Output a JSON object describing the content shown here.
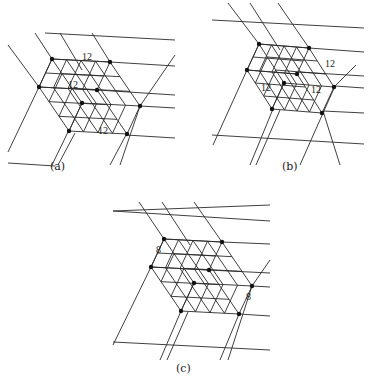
{
  "colors": {
    "line": "#2a2a2a",
    "dot": "#111111",
    "background": "#ffffff"
  },
  "panels": [
    {
      "id": "a",
      "caption": "(a)",
      "caption_pos": [
        50,
        168
      ],
      "origin": [
        52,
        59
      ],
      "A": [
        58,
        3
      ],
      "B": [
        30,
        44
      ],
      "C": [
        -13,
        28
      ],
      "divA": 4,
      "divB": 3,
      "divC": 2,
      "extra_lines": [
        [
          [
            45,
            33
          ],
          [
            175,
            40
          ]
        ],
        [
          [
            110,
            62
          ],
          [
            175,
            66
          ]
        ],
        [
          [
            97,
            90
          ],
          [
            175,
            95
          ]
        ],
        [
          [
            140,
            106
          ],
          [
            175,
            108
          ]
        ],
        [
          [
            126,
            135
          ],
          [
            175,
            138
          ]
        ],
        [
          [
            8,
            163
          ],
          [
            55,
            166
          ]
        ],
        [
          [
            8,
            45
          ],
          [
            39,
            87
          ]
        ],
        [
          [
            39,
            87
          ],
          [
            8,
            152
          ]
        ],
        [
          [
            35,
            33
          ],
          [
            52,
            59
          ]
        ],
        [
          [
            60,
            33
          ],
          [
            82,
            70
          ]
        ],
        [
          [
            92,
            33
          ],
          [
            110,
            62
          ]
        ],
        [
          [
            140,
            106
          ],
          [
            175,
            55
          ]
        ],
        [
          [
            126,
            135
          ],
          [
            110,
            165
          ]
        ],
        [
          [
            140,
            106
          ],
          [
            120,
            165
          ]
        ],
        [
          [
            68,
            132
          ],
          [
            52,
            165
          ]
        ],
        [
          [
            75,
            133
          ],
          [
            58,
            165
          ]
        ]
      ],
      "labels": [
        {
          "text": "12",
          "pos": [
            82,
            52
          ]
        },
        {
          "text": "12",
          "pos": [
            68,
            80
          ]
        },
        {
          "text": "12",
          "pos": [
            98,
            126
          ]
        }
      ]
    },
    {
      "id": "b",
      "caption": "(b)",
      "caption_pos": [
        282,
        168
      ],
      "origin": [
        259,
        44
      ],
      "A": [
        50,
        4
      ],
      "B": [
        25,
        39
      ],
      "C": [
        -12,
        26
      ],
      "divA": 4,
      "divB": 3,
      "divC": 2,
      "extra_lines": [
        [
          [
            212,
            20
          ],
          [
            364,
            28
          ]
        ],
        [
          [
            309,
            48
          ],
          [
            364,
            52
          ]
        ],
        [
          [
            298,
            72
          ],
          [
            364,
            76
          ]
        ],
        [
          [
            335,
            86
          ],
          [
            364,
            88
          ]
        ],
        [
          [
            323,
            111
          ],
          [
            364,
            113
          ]
        ],
        [
          [
            212,
            135
          ],
          [
            364,
            144
          ]
        ],
        [
          [
            228,
            3
          ],
          [
            259,
            44
          ]
        ],
        [
          [
            250,
            3
          ],
          [
            280,
            50
          ]
        ],
        [
          [
            278,
            3
          ],
          [
            309,
            48
          ]
        ],
        [
          [
            247,
            70
          ],
          [
            213,
            145
          ]
        ],
        [
          [
            335,
            86
          ],
          [
            356,
            65
          ]
        ],
        [
          [
            335,
            86
          ],
          [
            300,
            165
          ]
        ],
        [
          [
            323,
            111
          ],
          [
            340,
            165
          ]
        ],
        [
          [
            273,
            109
          ],
          [
            250,
            165
          ]
        ],
        [
          [
            280,
            110
          ],
          [
            256,
            165
          ]
        ]
      ],
      "labels": [
        {
          "text": "12",
          "pos": [
            325,
            59
          ]
        },
        {
          "text": "12",
          "pos": [
            261,
            83
          ]
        },
        {
          "text": "12",
          "pos": [
            311,
            85
          ]
        }
      ]
    },
    {
      "id": "c",
      "caption": "(c)",
      "caption_pos": [
        176,
        370
      ],
      "origin": [
        164,
        239
      ],
      "A": [
        58,
        3
      ],
      "B": [
        30,
        44
      ],
      "C": [
        -13,
        28
      ],
      "divA": 4,
      "divB": 3,
      "divC": 2,
      "extra_lines": [
        [
          [
            113,
            211
          ],
          [
            270,
            205
          ]
        ],
        [
          [
            113,
            211
          ],
          [
            270,
            221
          ]
        ],
        [
          [
            222,
            242
          ],
          [
            270,
            244
          ]
        ],
        [
          [
            208,
            270
          ],
          [
            270,
            273
          ]
        ],
        [
          [
            252,
            286
          ],
          [
            270,
            287
          ]
        ],
        [
          [
            239,
            314
          ],
          [
            270,
            316
          ]
        ],
        [
          [
            113,
            342
          ],
          [
            270,
            350
          ]
        ],
        [
          [
            139,
            202
          ],
          [
            164,
            239
          ]
        ],
        [
          [
            162,
            202
          ],
          [
            190,
            245
          ]
        ],
        [
          [
            194,
            202
          ],
          [
            222,
            242
          ]
        ],
        [
          [
            151,
            267
          ],
          [
            113,
            345
          ]
        ],
        [
          [
            252,
            286
          ],
          [
            270,
            260
          ]
        ],
        [
          [
            239,
            314
          ],
          [
            220,
            360
          ]
        ],
        [
          [
            252,
            286
          ],
          [
            228,
            360
          ]
        ],
        [
          [
            181,
            311
          ],
          [
            160,
            360
          ]
        ],
        [
          [
            188,
            312
          ],
          [
            167,
            360
          ]
        ]
      ],
      "labels": [
        {
          "text": "8",
          "pos": [
            156,
            245
          ]
        },
        {
          "text": "8",
          "pos": [
            246,
            292
          ]
        }
      ]
    }
  ]
}
